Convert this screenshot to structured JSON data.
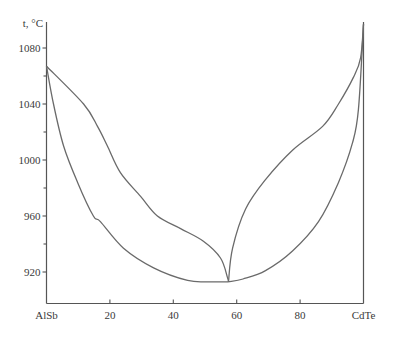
{
  "chart_data": {
    "type": "line",
    "title": "",
    "xlabel": "",
    "ylabel": "t, °C",
    "xlim": [
      0,
      100
    ],
    "ylim": [
      905,
      1100
    ],
    "grid": false,
    "legend": null,
    "x_ticks": [
      {
        "value": 0,
        "label": "AlSb"
      },
      {
        "value": 20,
        "label": "20"
      },
      {
        "value": 40,
        "label": "40"
      },
      {
        "value": 60,
        "label": "60"
      },
      {
        "value": 80,
        "label": "80"
      },
      {
        "value": 100,
        "label": "CdTe"
      }
    ],
    "y_ticks": [
      {
        "value": 920,
        "label": "920"
      },
      {
        "value": 960,
        "label": "960"
      },
      {
        "value": 1000,
        "label": "1000"
      },
      {
        "value": 1040,
        "label": "1040"
      },
      {
        "value": 1080,
        "label": "1080"
      }
    ],
    "y_minor_ticks": [
      940,
      980,
      1020,
      1060
    ],
    "series": [
      {
        "name": "liquidus-left",
        "x": [
          0,
          11.7,
          16.1,
          19.2,
          23.3,
          29.7,
          35.0,
          42.3,
          49.5,
          54.9,
          57.1,
          57.4
        ],
        "y": [
          1067,
          1040,
          1024,
          1010,
          991,
          974,
          960,
          951,
          942,
          930,
          916,
          913
        ]
      },
      {
        "name": "solidus-left",
        "x": [
          0,
          2.2,
          5.4,
          9.8,
          14.8,
          17.0,
          24.3,
          33.8,
          44.5,
          51.0,
          57.4
        ],
        "y": [
          1067,
          1040,
          1010,
          984,
          960,
          956,
          937,
          923,
          914,
          913,
          913
        ]
      },
      {
        "name": "liquidus-right",
        "x": [
          57.4,
          58.7,
          62.8,
          69.1,
          77.6,
          87.1,
          92.1,
          96.8,
          99.1,
          100
        ],
        "y": [
          913,
          937,
          965,
          986,
          1007,
          1024,
          1040,
          1059,
          1073,
          1097
        ]
      },
      {
        "name": "solidus-right",
        "x": [
          57.4,
          62.0,
          69.1,
          77.6,
          85.8,
          92.1,
          96.5,
          98.4,
          100
        ],
        "y": [
          913,
          915,
          921,
          935,
          956,
          984,
          1012,
          1036,
          1097
        ]
      }
    ],
    "annotations": [
      {
        "text": "minimum (congruent point)",
        "x": 57.4,
        "y": 913
      }
    ]
  },
  "labels": {
    "y_axis_title": "t, °C"
  },
  "colors": {
    "curve": "#6a6a6a",
    "axis": "#555555",
    "text": "#3a3a3a"
  }
}
